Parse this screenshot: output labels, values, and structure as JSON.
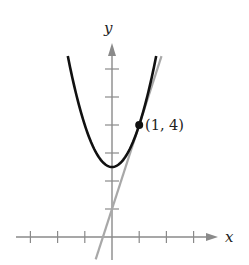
{
  "chart_data": {
    "type": "line",
    "title": "",
    "xlabel": "x",
    "ylabel": "y",
    "xlim": [
      -3,
      3
    ],
    "ylim": [
      -0.8,
      6.5
    ],
    "x_ticks": [
      -3,
      -2,
      -1,
      1,
      2,
      3
    ],
    "y_ticks": [
      1,
      2,
      3,
      4,
      5,
      6
    ],
    "tick_labels_shown": false,
    "grid": false,
    "series": [
      {
        "name": "parabola",
        "equation": "y = 1.5x^2 + 2.5",
        "color": "#111111",
        "x": [
          -1.625,
          -1.5,
          -1,
          -0.5,
          0,
          0.5,
          1,
          1.5,
          1.625
        ],
        "y": [
          6.46,
          5.875,
          4.0,
          2.875,
          2.5,
          2.875,
          4.0,
          5.875,
          6.46
        ]
      },
      {
        "name": "tangent line",
        "equation": "y = 3x + 1",
        "color": "#a8a8a8",
        "x": [
          -0.6,
          1.82
        ],
        "y": [
          -0.8,
          6.46
        ]
      }
    ],
    "annotations": [
      {
        "type": "point",
        "x": 1,
        "y": 4,
        "label": "(1, 4)"
      }
    ]
  },
  "labels": {
    "x_axis": "x",
    "y_axis": "y",
    "point": "(1, 4)"
  }
}
